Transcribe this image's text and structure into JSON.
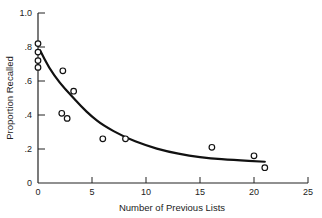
{
  "chart_data": {
    "type": "scatter",
    "title": "",
    "xlabel": "Number of Previous Lists",
    "ylabel": "Proportion Recalled",
    "xlim": [
      0,
      25
    ],
    "ylim": [
      0,
      1.0
    ],
    "xticks": [
      0,
      5,
      10,
      15,
      20,
      25
    ],
    "xtick_labels": [
      "0",
      "5",
      "10",
      "15",
      "20",
      "25"
    ],
    "yticks": [
      0,
      0.2,
      0.4,
      0.6,
      0.8,
      1.0
    ],
    "ytick_labels": [
      "0",
      ".2",
      ".4",
      ".6",
      ".8",
      "1.0"
    ],
    "grid": false,
    "legend": null,
    "series": [
      {
        "name": "Observed",
        "marker": "open-circle",
        "points": [
          {
            "x": 0,
            "y": 0.82
          },
          {
            "x": 0,
            "y": 0.77
          },
          {
            "x": 0,
            "y": 0.72
          },
          {
            "x": 0,
            "y": 0.68
          },
          {
            "x": 2.3,
            "y": 0.66
          },
          {
            "x": 3.3,
            "y": 0.54
          },
          {
            "x": 2.2,
            "y": 0.41
          },
          {
            "x": 2.7,
            "y": 0.38
          },
          {
            "x": 6.0,
            "y": 0.26
          },
          {
            "x": 8.1,
            "y": 0.26
          },
          {
            "x": 16.1,
            "y": 0.21
          },
          {
            "x": 20.0,
            "y": 0.16
          },
          {
            "x": 21.0,
            "y": 0.09
          }
        ]
      },
      {
        "name": "Fitted curve",
        "type": "line",
        "points": [
          {
            "x": 0.2,
            "y": 0.78
          },
          {
            "x": 1,
            "y": 0.68
          },
          {
            "x": 2,
            "y": 0.59
          },
          {
            "x": 3,
            "y": 0.52
          },
          {
            "x": 4,
            "y": 0.45
          },
          {
            "x": 5,
            "y": 0.39
          },
          {
            "x": 6,
            "y": 0.34
          },
          {
            "x": 8,
            "y": 0.27
          },
          {
            "x": 10,
            "y": 0.22
          },
          {
            "x": 12,
            "y": 0.185
          },
          {
            "x": 14,
            "y": 0.16
          },
          {
            "x": 16,
            "y": 0.145
          },
          {
            "x": 18,
            "y": 0.135
          },
          {
            "x": 21,
            "y": 0.125
          }
        ]
      }
    ]
  }
}
